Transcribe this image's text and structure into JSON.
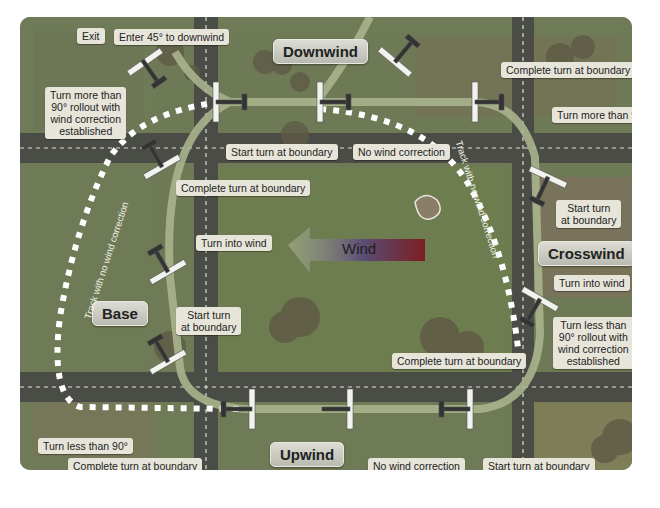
{
  "diagram": {
    "legs": {
      "downwind": "Downwind",
      "crosswind": "Crosswind",
      "upwind": "Upwind",
      "base": "Base"
    },
    "wind": {
      "label": "Wind",
      "direction": "left"
    },
    "track_labels": {
      "left": "Track with no wind correction",
      "right": "Track with no wind correction"
    },
    "callouts": {
      "exit": "Exit",
      "enter_45": "Enter 45° to downwind",
      "turn_more_90_rollout_left": [
        "Turn more than",
        "90° rollout with",
        "wind correction",
        "established"
      ],
      "start_turn_boundary_top": "Start turn at boundary",
      "no_wind_correction_top": "No wind correction",
      "complete_turn_boundary_top_right": "Complete turn at boundary",
      "turn_more_90_right": "Turn more than 90°",
      "complete_turn_boundary_top_left": "Complete turn at boundary",
      "start_turn_boundary_right": [
        "Start turn",
        "at boundary"
      ],
      "turn_into_wind_right": "Turn into wind",
      "turn_less_90_rollout_right": [
        "Turn less than",
        "90° rollout with",
        "wind correction",
        "established"
      ],
      "complete_turn_boundary_bottom_right": "Complete turn at boundary",
      "turn_into_wind_left": "Turn into wind",
      "start_turn_boundary_left": [
        "Start turn",
        "at boundary"
      ],
      "turn_less_90_bottom_left": "Turn less than 90°",
      "complete_turn_boundary_bottom_left": "Complete turn at boundary",
      "no_wind_correction_bottom": "No wind correction",
      "start_turn_boundary_bottom": "Start turn at boundary"
    },
    "colors": {
      "field": "#6f7a56",
      "path": "#a9b48d",
      "track_dots": "#ffffff",
      "road": "#4a4d45",
      "label_bg": "#e7e5da"
    }
  }
}
